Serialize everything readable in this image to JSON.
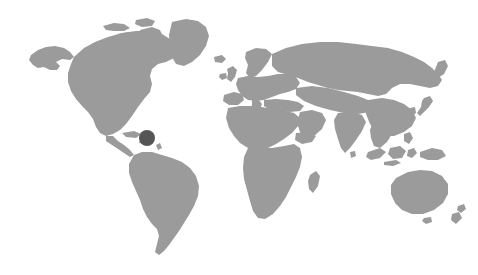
{
  "figure": {
    "kind": "world-map-locator",
    "width": 478,
    "height": 275,
    "background_color": "#ffffff",
    "alt_text": "Grayscale world map with a single dark marker in the Caribbean / western Atlantic region",
    "caption": ""
  },
  "map": {
    "projection": "equirectangular",
    "land_color": "#9b9b9b",
    "ocean_color": "#ffffff",
    "border_color": "none",
    "bounds_px": {
      "left": 30,
      "top": 18,
      "right": 448,
      "bottom": 258
    },
    "labels_visible": false,
    "graticule_visible": false,
    "regions": [
      {
        "name": "North America"
      },
      {
        "name": "Greenland"
      },
      {
        "name": "South America"
      },
      {
        "name": "Europe"
      },
      {
        "name": "Africa"
      },
      {
        "name": "Asia"
      },
      {
        "name": "Australia"
      },
      {
        "name": "New Zealand"
      },
      {
        "name": "Indonesia"
      },
      {
        "name": "Japan"
      },
      {
        "name": "British Isles"
      },
      {
        "name": "Madagascar"
      }
    ]
  },
  "markers": [
    {
      "id": "marker-1",
      "label": "",
      "color": "#555555",
      "diameter_px": 16,
      "x_px": 147,
      "y_px": 138,
      "region_hint": "Caribbean / western Atlantic"
    }
  ]
}
